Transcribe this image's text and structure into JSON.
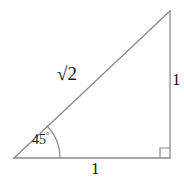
{
  "figure": {
    "background_color": "#ffffff",
    "stroke_color": "#8c8c8c",
    "text_color": "#1a1a1a"
  },
  "labels": {
    "hypotenuse": {
      "radical": "√",
      "radicand": "2",
      "full_text": "√2"
    },
    "leg_vertical": "1",
    "leg_base": "1",
    "angle": {
      "value": "45",
      "degree_symbol": "°",
      "full_text": "45°"
    }
  },
  "geometry": {
    "vertices": {
      "left": [
        14,
        158
      ],
      "bottom_right": [
        170,
        158
      ],
      "top_right": [
        170,
        11
      ]
    },
    "angle_arc": {
      "center": [
        14,
        158
      ],
      "radius": 46,
      "start_angle_deg": 0,
      "end_angle_deg": 45
    },
    "right_angle_marker": {
      "corner": [
        170,
        158
      ],
      "size": 10
    }
  }
}
